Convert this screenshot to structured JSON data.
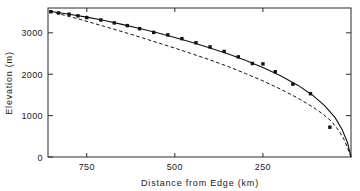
{
  "chart_data": {
    "type": "scatter",
    "title": "",
    "xlabel": "Distance from Edge  (km)",
    "ylabel": "Elevation  (m)",
    "xlim": [
      860,
      0
    ],
    "ylim": [
      0,
      3600
    ],
    "x_ticks": [
      750,
      500,
      250
    ],
    "x_tick_labels": [
      "750",
      "500",
      "250"
    ],
    "y_ticks": [
      0,
      1000,
      2000,
      3000
    ],
    "y_tick_labels": [
      "0",
      "1000",
      "2000",
      "3000"
    ],
    "x_axis_direction": "decreasing",
    "grid": false,
    "legend": "none",
    "frame": "box-all-four-sides-inward-ticks",
    "series": [
      {
        "name": "observed profile",
        "type": "scatter",
        "marker": "filled-square",
        "color": "#111111",
        "points": [
          {
            "x": 852,
            "y": 3510
          },
          {
            "x": 830,
            "y": 3480
          },
          {
            "x": 800,
            "y": 3450
          },
          {
            "x": 775,
            "y": 3410
          },
          {
            "x": 750,
            "y": 3370
          },
          {
            "x": 710,
            "y": 3310
          },
          {
            "x": 672,
            "y": 3240
          },
          {
            "x": 635,
            "y": 3175
          },
          {
            "x": 600,
            "y": 3100
          },
          {
            "x": 560,
            "y": 3010
          },
          {
            "x": 520,
            "y": 2950
          },
          {
            "x": 480,
            "y": 2860
          },
          {
            "x": 440,
            "y": 2760
          },
          {
            "x": 400,
            "y": 2660
          },
          {
            "x": 360,
            "y": 2550
          },
          {
            "x": 320,
            "y": 2420
          },
          {
            "x": 280,
            "y": 2260
          },
          {
            "x": 250,
            "y": 2250
          },
          {
            "x": 215,
            "y": 2060
          },
          {
            "x": 165,
            "y": 1760
          },
          {
            "x": 115,
            "y": 1530
          },
          {
            "x": 60,
            "y": 720
          }
        ]
      },
      {
        "name": "model fit",
        "type": "line",
        "style": "solid",
        "color": "#111111",
        "points": [
          {
            "x": 855,
            "y": 3520
          },
          {
            "x": 800,
            "y": 3450
          },
          {
            "x": 750,
            "y": 3380
          },
          {
            "x": 700,
            "y": 3300
          },
          {
            "x": 650,
            "y": 3205
          },
          {
            "x": 600,
            "y": 3105
          },
          {
            "x": 550,
            "y": 3000
          },
          {
            "x": 500,
            "y": 2885
          },
          {
            "x": 450,
            "y": 2765
          },
          {
            "x": 400,
            "y": 2635
          },
          {
            "x": 350,
            "y": 2495
          },
          {
            "x": 300,
            "y": 2340
          },
          {
            "x": 250,
            "y": 2165
          },
          {
            "x": 200,
            "y": 1965
          },
          {
            "x": 150,
            "y": 1730
          },
          {
            "x": 110,
            "y": 1500
          },
          {
            "x": 75,
            "y": 1240
          },
          {
            "x": 45,
            "y": 950
          },
          {
            "x": 25,
            "y": 660
          },
          {
            "x": 10,
            "y": 350
          },
          {
            "x": 0,
            "y": 0
          }
        ]
      },
      {
        "name": "reference curve",
        "type": "line",
        "style": "dashed",
        "color": "#111111",
        "points": [
          {
            "x": 855,
            "y": 3520
          },
          {
            "x": 820,
            "y": 3440
          },
          {
            "x": 780,
            "y": 3350
          },
          {
            "x": 740,
            "y": 3255
          },
          {
            "x": 700,
            "y": 3155
          },
          {
            "x": 650,
            "y": 3030
          },
          {
            "x": 600,
            "y": 2900
          },
          {
            "x": 550,
            "y": 2765
          },
          {
            "x": 500,
            "y": 2630
          },
          {
            "x": 450,
            "y": 2490
          },
          {
            "x": 400,
            "y": 2345
          },
          {
            "x": 350,
            "y": 2190
          },
          {
            "x": 300,
            "y": 2020
          },
          {
            "x": 250,
            "y": 1840
          },
          {
            "x": 200,
            "y": 1640
          },
          {
            "x": 150,
            "y": 1420
          },
          {
            "x": 110,
            "y": 1215
          },
          {
            "x": 80,
            "y": 1040
          },
          {
            "x": 55,
            "y": 860
          },
          {
            "x": 35,
            "y": 640
          },
          {
            "x": 18,
            "y": 400
          },
          {
            "x": 0,
            "y": 0
          }
        ]
      }
    ]
  }
}
